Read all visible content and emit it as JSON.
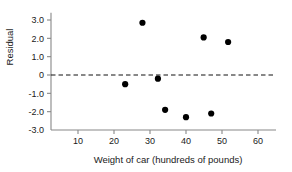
{
  "chart_data": {
    "type": "scatter",
    "title": "",
    "xlabel": "Weight of car  (hundreds of pounds)",
    "ylabel": "Residual",
    "xlim": [
      4,
      65
    ],
    "ylim": [
      -3.0,
      3.4
    ],
    "xticks": [
      10,
      20,
      30,
      40,
      50,
      60
    ],
    "xtick_labels": [
      "10",
      "20",
      "30",
      "40",
      "50",
      "60"
    ],
    "yticks": [
      3.0,
      2.0,
      1.0,
      0,
      -1.0,
      -2.0,
      -3.0
    ],
    "ytick_labels": [
      "3.0",
      "2.0",
      "1.0",
      "0",
      "-1.0",
      "-2.0",
      "-3.0"
    ],
    "grid": false,
    "legend": null,
    "reference_lines": [
      {
        "name": "zero-residual-line",
        "axis": "y",
        "value": 0,
        "style": "dashed",
        "color": "#111111"
      }
    ],
    "marker": {
      "shape": "circle",
      "color": "#000000",
      "size": 3.1
    },
    "points": [
      {
        "x": 23.1,
        "y": -0.5
      },
      {
        "x": 27.9,
        "y": 2.85
      },
      {
        "x": 32.2,
        "y": -0.2
      },
      {
        "x": 34.2,
        "y": -1.9
      },
      {
        "x": 40.0,
        "y": -2.3
      },
      {
        "x": 44.9,
        "y": 2.05
      },
      {
        "x": 47.0,
        "y": -2.1
      },
      {
        "x": 51.7,
        "y": 1.8
      }
    ]
  },
  "colors": {
    "background": "#ffffff",
    "axis": "#888888",
    "text": "#1a1a1a",
    "marker": "#000000",
    "zero_line": "#111111"
  }
}
